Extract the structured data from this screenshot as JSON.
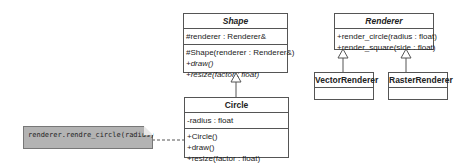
{
  "classes": {
    "shape": {
      "name": "Shape",
      "abstract": true,
      "attributes": [
        "#renderer : Renderer&"
      ],
      "operations": [
        "#Shape(renderer : Renderer&)",
        "+draw()",
        "+resize(factor : float)"
      ]
    },
    "circle": {
      "name": "Circle",
      "attributes": [
        "-radius : float"
      ],
      "operations": [
        "+Circle()",
        "+draw()",
        "+resize(factor : float)"
      ]
    },
    "renderer": {
      "name": "Renderer",
      "abstract": true,
      "operations": [
        "+render_circle(radius : float)",
        "+render_square(side : float)"
      ]
    },
    "vector_renderer": {
      "name": "VectorRenderer"
    },
    "raster_renderer": {
      "name": "RasterRenderer"
    }
  },
  "note": {
    "text": "renderer.rendre_circle(radius)"
  },
  "relations": [
    {
      "type": "generalization",
      "from": "Circle",
      "to": "Shape"
    },
    {
      "type": "generalization",
      "from": "VectorRenderer",
      "to": "Renderer"
    },
    {
      "type": "generalization",
      "from": "RasterRenderer",
      "to": "Renderer"
    },
    {
      "type": "note-anchor",
      "from": "note",
      "to": "Circle.draw()"
    }
  ]
}
